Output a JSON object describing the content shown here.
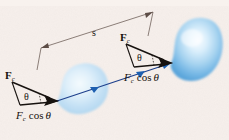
{
  "figure": {
    "background_color": "#f6efeb",
    "width": 229,
    "height": 140,
    "labels": {
      "force_left": {
        "symbol": "F",
        "subscript": "c",
        "text": "Fc"
      },
      "force_right": {
        "symbol": "F",
        "subscript": "c",
        "text": "Fc"
      },
      "component_left": {
        "symbol": "F",
        "subscript": "c",
        "operator": "cos",
        "angle": "θ",
        "text": "Fc cos θ"
      },
      "component_right": {
        "symbol": "F",
        "subscript": "c",
        "operator": "cos",
        "angle": "θ",
        "text": "Fc cos θ"
      },
      "theta_left": "θ",
      "theta_right": "θ",
      "displacement": "s"
    },
    "colors": {
      "ink": "#17120f",
      "blob_light": "#bcdcf2",
      "blob_dark": "#5aa9dc",
      "blob_highlight": "#f2fafe",
      "displacement_arrow": "#1d3f8c",
      "dimension_line": "#5a4b45",
      "background": "#f6efeb"
    },
    "objects": [
      {
        "name": "object-start",
        "position": "left",
        "shape": "blob",
        "cx": 80,
        "cy": 90,
        "rx": 28,
        "ry": 27
      },
      {
        "name": "object-end",
        "position": "right",
        "shape": "blob",
        "cx": 186,
        "cy": 50,
        "rx": 34,
        "ry": 33
      }
    ],
    "vectors": [
      {
        "name": "force-left",
        "label": "Fc",
        "tail": [
          12,
          82
        ],
        "head": [
          57,
          101
        ],
        "angle_label": "θ"
      },
      {
        "name": "component-left",
        "label": "Fc cos θ",
        "tail": [
          20,
          105
        ],
        "head": [
          57,
          101
        ]
      },
      {
        "name": "force-right",
        "label": "Fc",
        "tail": [
          126,
          44
        ],
        "head": [
          171,
          63
        ],
        "angle_label": "θ"
      },
      {
        "name": "component-right",
        "label": "Fc cos θ",
        "tail": [
          134,
          67
        ],
        "head": [
          171,
          63
        ]
      },
      {
        "name": "displacement-arrow",
        "label": "s",
        "tail": [
          57,
          101
        ],
        "head": [
          171,
          63
        ]
      }
    ],
    "dimension": {
      "name": "displacement-dimension",
      "label": "s",
      "from": [
        41,
        48
      ],
      "to": [
        153,
        12
      ]
    }
  }
}
